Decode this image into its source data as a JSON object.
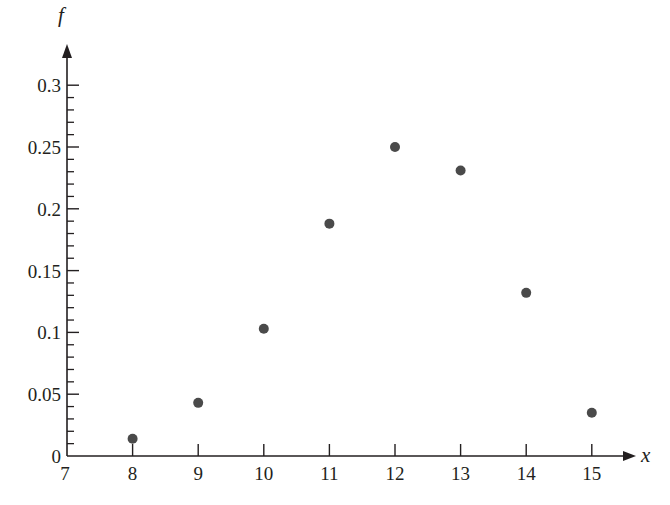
{
  "chart_data": {
    "type": "scatter",
    "title": "",
    "xlabel": "x",
    "ylabel": "f",
    "xlim": [
      7,
      15.6
    ],
    "ylim": [
      0,
      0.32
    ],
    "grid": false,
    "legend": null,
    "x_ticks": [
      7,
      8,
      9,
      10,
      11,
      12,
      13,
      14,
      15
    ],
    "x_tick_labels": [
      "7",
      "8",
      "9",
      "10",
      "11",
      "12",
      "13",
      "14",
      "15"
    ],
    "y_major_ticks": [
      0,
      0.05,
      0.1,
      0.15,
      0.2,
      0.25,
      0.3
    ],
    "y_tick_labels": [
      "0",
      "0.05",
      "0.1",
      "0.15",
      "0.2",
      "0.25",
      "0.3"
    ],
    "y_minor_tick_step": 0.01,
    "series": [
      {
        "name": "f(x)",
        "x": [
          8,
          9,
          10,
          11,
          12,
          13,
          14,
          15
        ],
        "values": [
          0.014,
          0.043,
          0.103,
          0.188,
          0.25,
          0.231,
          0.132,
          0.035
        ]
      }
    ]
  },
  "style": {
    "axis_color": "#231f20",
    "point_color": "#4a4a4a",
    "background": "#ffffff"
  }
}
